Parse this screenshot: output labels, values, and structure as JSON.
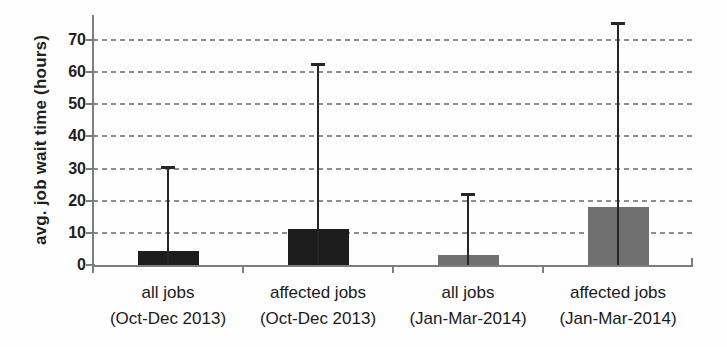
{
  "chart_data": {
    "type": "bar",
    "title": "",
    "xlabel": "",
    "ylabel": "avg. job wait time (hours)",
    "ylim": [
      0,
      70
    ],
    "yticks": [
      0,
      10,
      20,
      30,
      40,
      50,
      60,
      70
    ],
    "grid": "horizontal-dashed",
    "legend_position": "none",
    "error_bars": "upper-only",
    "categories": [
      "all jobs (Oct-Dec 2013)",
      "affected jobs (Oct-Dec 2013)",
      "all jobs (Jan-Mar-2014)",
      "affected jobs (Jan-Mar-2014)"
    ],
    "bars": [
      {
        "label_line1": "all jobs",
        "label_line2": "(Oct-Dec 2013)",
        "value": 4.3,
        "error_high": 30.5,
        "color": "#1d1d1d"
      },
      {
        "label_line1": "affected jobs",
        "label_line2": "(Oct-Dec 2013)",
        "value": 11.1,
        "error_high": 62.5,
        "color": "#1d1d1d"
      },
      {
        "label_line1": "all jobs",
        "label_line2": "(Jan-Mar-2014)",
        "value": 3.2,
        "error_high": 22.2,
        "color": "#707070"
      },
      {
        "label_line1": "affected jobs",
        "label_line2": "(Jan-Mar-2014)",
        "value": 18.0,
        "error_high": 75.4,
        "color": "#707070"
      }
    ],
    "colors": {
      "bar_2013": "#1d1d1d",
      "bar_2014": "#707070",
      "error_bar": "#262626",
      "axis": "#7d7d7d",
      "gridline": "#8f8f8f",
      "text": "#1f1f1f",
      "background": "#fefefe"
    }
  }
}
